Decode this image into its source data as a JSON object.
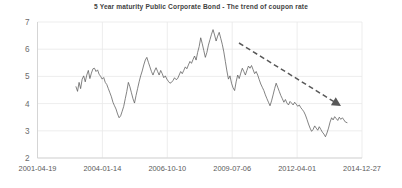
{
  "chart_data": {
    "type": "line",
    "title": "5 Year maturity Public Corporate Bond - The trend of coupon rate",
    "xlabel": "",
    "ylabel": "",
    "ylim": [
      2,
      7
    ],
    "yticks": [
      2,
      3,
      4,
      5,
      6,
      7
    ],
    "ytick_labels": [
      "2",
      "3",
      "4",
      "5",
      "6",
      "7"
    ],
    "xtick_labels": [
      "2001-04-19",
      "2004-01-14",
      "2006-10-10",
      "2009-07-06",
      "2012-04-01",
      "2014-12-27"
    ],
    "grid": true,
    "legend": "none",
    "series": [
      {
        "name": "Coupon rate",
        "color": "#5a5a5a",
        "x_start_label": "2003-06",
        "x_end_label": "2014-06",
        "values": [
          4.62,
          4.45,
          4.78,
          4.55,
          4.9,
          5.02,
          4.8,
          5.05,
          5.22,
          4.92,
          5.12,
          5.28,
          5.3,
          5.18,
          5.24,
          5.08,
          5.0,
          4.9,
          4.96,
          4.78,
          4.7,
          4.55,
          4.4,
          4.25,
          4.05,
          3.92,
          3.8,
          3.62,
          3.48,
          3.55,
          3.72,
          3.9,
          4.18,
          4.45,
          4.78,
          4.62,
          4.4,
          4.18,
          4.02,
          4.3,
          4.55,
          4.8,
          5.02,
          5.2,
          5.42,
          5.6,
          5.7,
          5.52,
          5.35,
          5.18,
          5.05,
          5.2,
          5.32,
          5.18,
          5.05,
          5.22,
          5.1,
          4.95,
          5.02,
          4.9,
          4.82,
          4.75,
          4.78,
          4.85,
          4.95,
          4.88,
          4.92,
          5.05,
          5.18,
          5.1,
          5.22,
          5.35,
          5.28,
          5.42,
          5.55,
          5.48,
          5.62,
          5.75,
          5.6,
          5.88,
          6.1,
          6.42,
          6.2,
          5.95,
          5.7,
          5.88,
          6.15,
          6.35,
          6.55,
          6.72,
          6.52,
          6.3,
          6.48,
          6.62,
          6.4,
          6.18,
          5.9,
          5.55,
          5.2,
          4.9,
          5.02,
          4.75,
          4.58,
          4.48,
          4.8,
          5.05,
          4.92,
          5.12,
          5.3,
          5.18,
          5.05,
          5.22,
          5.38,
          5.3,
          5.4,
          5.25,
          5.1,
          5.18,
          5.05,
          4.88,
          4.72,
          4.6,
          4.48,
          4.32,
          4.18,
          4.05,
          3.92,
          4.1,
          4.32,
          4.55,
          4.75,
          4.6,
          4.45,
          4.3,
          4.18,
          4.05,
          4.15,
          4.02,
          3.95,
          4.08,
          4.02,
          3.95,
          4.05,
          3.98,
          3.9,
          3.95,
          3.85,
          3.78,
          3.7,
          3.58,
          3.42,
          3.25,
          3.1,
          2.98,
          3.05,
          3.18,
          3.1,
          3.02,
          3.15,
          3.05,
          2.95,
          2.88,
          2.78,
          2.92,
          3.1,
          3.32,
          3.48,
          3.4,
          3.52,
          3.45,
          3.38,
          3.5,
          3.42,
          3.48,
          3.4,
          3.32,
          3.3
        ]
      }
    ],
    "annotations": [
      {
        "name": "downtrend-arrow",
        "type": "dashed-arrow",
        "color": "#585858",
        "start": [
          239,
          43
        ],
        "end": [
          341,
          106
        ]
      }
    ]
  }
}
